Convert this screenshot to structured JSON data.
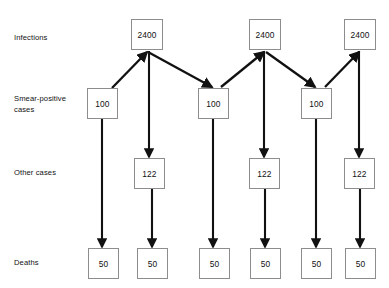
{
  "diagram": {
    "type": "flow-diagram",
    "background_color": "#ffffff",
    "box_border_color": "#8d8d8d",
    "arrow_color": "#111111",
    "row_labels": [
      {
        "id": "infections",
        "text": "Infections",
        "x": 14,
        "y": 33
      },
      {
        "id": "smear-positive-cases",
        "text": "Smear-positive\ncases",
        "x": 14,
        "y": 94
      },
      {
        "id": "other-cases",
        "text": "Other cases",
        "x": 14,
        "y": 168
      },
      {
        "id": "deaths",
        "text": "Deaths",
        "x": 14,
        "y": 258
      }
    ],
    "nodes": [
      {
        "id": "infections-1",
        "row": "infections",
        "value": "2400",
        "x": 131,
        "y": 19,
        "w": 32,
        "h": 31
      },
      {
        "id": "infections-2",
        "row": "infections",
        "value": "2400",
        "x": 249,
        "y": 19,
        "w": 32,
        "h": 31
      },
      {
        "id": "infections-3",
        "row": "infections",
        "value": "2400",
        "x": 344,
        "y": 19,
        "w": 32,
        "h": 31
      },
      {
        "id": "smear-1",
        "row": "smear-positive-cases",
        "value": "100",
        "x": 87,
        "y": 88,
        "w": 31,
        "h": 31
      },
      {
        "id": "smear-2",
        "row": "smear-positive-cases",
        "value": "100",
        "x": 198,
        "y": 88,
        "w": 31,
        "h": 31
      },
      {
        "id": "smear-3",
        "row": "smear-positive-cases",
        "value": "100",
        "x": 301,
        "y": 88,
        "w": 31,
        "h": 31
      },
      {
        "id": "other-1",
        "row": "other-cases",
        "value": "122",
        "x": 134,
        "y": 158,
        "w": 31,
        "h": 31
      },
      {
        "id": "other-2",
        "row": "other-cases",
        "value": "122",
        "x": 249,
        "y": 158,
        "w": 31,
        "h": 31
      },
      {
        "id": "other-3",
        "row": "other-cases",
        "value": "122",
        "x": 344,
        "y": 158,
        "w": 31,
        "h": 31
      },
      {
        "id": "deaths-1",
        "row": "deaths",
        "value": "50",
        "x": 88,
        "y": 248,
        "w": 31,
        "h": 31
      },
      {
        "id": "deaths-2",
        "row": "deaths",
        "value": "50",
        "x": 137,
        "y": 248,
        "w": 31,
        "h": 31
      },
      {
        "id": "deaths-3",
        "row": "deaths",
        "value": "50",
        "x": 199,
        "y": 248,
        "w": 31,
        "h": 31
      },
      {
        "id": "deaths-4",
        "row": "deaths",
        "value": "50",
        "x": 250,
        "y": 248,
        "w": 31,
        "h": 31
      },
      {
        "id": "deaths-5",
        "row": "deaths",
        "value": "50",
        "x": 301,
        "y": 248,
        "w": 31,
        "h": 31
      },
      {
        "id": "deaths-6",
        "row": "deaths",
        "value": "50",
        "x": 345,
        "y": 248,
        "w": 31,
        "h": 31
      }
    ],
    "edges": [
      {
        "id": "edge-smear1-to-infections1",
        "from": "smear-1",
        "to": "infections-1",
        "kind": "diagonal-up",
        "x1": 112,
        "y1": 88,
        "x2": 147,
        "y2": 52
      },
      {
        "id": "edge-infections1-to-smear2",
        "from": "infections-1",
        "to": "smear-2",
        "kind": "diagonal-down",
        "x1": 148,
        "y1": 52,
        "x2": 212,
        "y2": 87
      },
      {
        "id": "edge-smear2-to-infections2",
        "from": "smear-2",
        "to": "infections-2",
        "kind": "diagonal-up",
        "x1": 221,
        "y1": 87,
        "x2": 264,
        "y2": 52
      },
      {
        "id": "edge-infections2-to-smear3",
        "from": "infections-2",
        "to": "smear-3",
        "kind": "diagonal-down",
        "x1": 266,
        "y1": 52,
        "x2": 315,
        "y2": 87
      },
      {
        "id": "edge-smear3-to-infections3",
        "from": "smear-3",
        "to": "infections-3",
        "kind": "diagonal-up",
        "x1": 325,
        "y1": 87,
        "x2": 359,
        "y2": 52
      },
      {
        "id": "edge-infections1-to-other1",
        "from": "infections-1",
        "to": "other-1",
        "kind": "vertical",
        "x1": 149,
        "y1": 51,
        "x2": 149,
        "y2": 157
      },
      {
        "id": "edge-infections2-to-other2",
        "from": "infections-2",
        "to": "other-2",
        "kind": "vertical",
        "x1": 264,
        "y1": 51,
        "x2": 264,
        "y2": 157
      },
      {
        "id": "edge-infections3-to-other3",
        "from": "infections-3",
        "to": "other-3",
        "kind": "vertical",
        "x1": 359,
        "y1": 51,
        "x2": 359,
        "y2": 157
      },
      {
        "id": "edge-smear1-to-deaths1",
        "from": "smear-1",
        "to": "deaths-1",
        "kind": "vertical",
        "x1": 102,
        "y1": 119,
        "x2": 102,
        "y2": 247
      },
      {
        "id": "edge-smear2-to-deaths3",
        "from": "smear-2",
        "to": "deaths-3",
        "kind": "vertical",
        "x1": 213,
        "y1": 119,
        "x2": 213,
        "y2": 247
      },
      {
        "id": "edge-smear3-to-deaths5",
        "from": "smear-3",
        "to": "deaths-5",
        "kind": "vertical",
        "x1": 316,
        "y1": 119,
        "x2": 316,
        "y2": 247
      },
      {
        "id": "edge-other1-to-deaths2",
        "from": "other-1",
        "to": "deaths-2",
        "kind": "vertical",
        "x1": 152,
        "y1": 189,
        "x2": 152,
        "y2": 247
      },
      {
        "id": "edge-other2-to-deaths4",
        "from": "other-2",
        "to": "deaths-4",
        "kind": "vertical",
        "x1": 265,
        "y1": 189,
        "x2": 265,
        "y2": 247
      },
      {
        "id": "edge-other3-to-deaths6",
        "from": "other-3",
        "to": "deaths-6",
        "kind": "vertical",
        "x1": 360,
        "y1": 189,
        "x2": 360,
        "y2": 247
      }
    ]
  }
}
